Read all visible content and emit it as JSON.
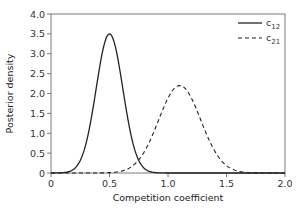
{
  "chart_data": {
    "type": "line",
    "title": "",
    "xlabel": "Competition coefficient",
    "ylabel": "Posterior density",
    "xlim": [
      0,
      2.0
    ],
    "ylim": [
      0,
      4.0
    ],
    "xticks": [
      0,
      0.5,
      1.0,
      1.5,
      2.0
    ],
    "xtick_labels": [
      "0",
      "0.5",
      "1.0",
      "1.5",
      "2.0"
    ],
    "yticks": [
      0,
      0.5,
      1.0,
      1.5,
      2.0,
      2.5,
      3.0,
      3.5,
      4.0
    ],
    "ytick_labels": [
      "0",
      "0.5",
      "1.0",
      "1.5",
      "2.0",
      "2.5",
      "3.0",
      "3.5",
      "4.0"
    ],
    "grid": false,
    "legend_position": "upper right",
    "series": [
      {
        "name": "c12",
        "label_base": "c",
        "label_sub": "12",
        "style": "solid",
        "color": "#222222",
        "distribution": "approximately normal",
        "mean": 0.5,
        "sd": 0.114,
        "peak_density": 3.5,
        "x": [
          0.1,
          0.2,
          0.25,
          0.3,
          0.35,
          0.4,
          0.45,
          0.5,
          0.55,
          0.6,
          0.65,
          0.7,
          0.75,
          0.8,
          0.9
        ],
        "y": [
          0.01,
          0.1,
          0.32,
          0.75,
          1.47,
          2.38,
          3.2,
          3.5,
          3.2,
          2.38,
          1.47,
          0.75,
          0.32,
          0.1,
          0.01
        ]
      },
      {
        "name": "c21",
        "label_base": "c",
        "label_sub": "21",
        "style": "dashed",
        "color": "#222222",
        "distribution": "approximately normal",
        "mean": 1.1,
        "sd": 0.18,
        "peak_density": 2.2,
        "x": [
          0.5,
          0.6,
          0.7,
          0.8,
          0.9,
          1.0,
          1.1,
          1.2,
          1.3,
          1.4,
          1.5,
          1.6,
          1.7,
          1.8
        ],
        "y": [
          0.01,
          0.05,
          0.19,
          0.55,
          1.18,
          1.89,
          2.2,
          1.89,
          1.18,
          0.55,
          0.19,
          0.05,
          0.01,
          0.0
        ]
      }
    ]
  },
  "layout": {
    "plot_left": 51,
    "plot_right": 285,
    "plot_top": 14,
    "plot_bottom": 173
  }
}
